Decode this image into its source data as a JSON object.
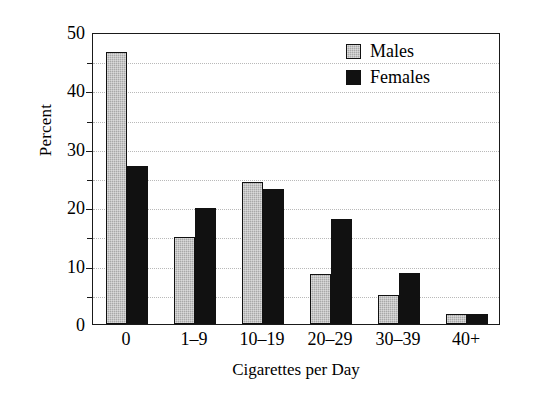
{
  "chart_data": {
    "type": "bar",
    "title": "",
    "xlabel": "Cigarettes per Day",
    "ylabel": "Percent",
    "categories": [
      "0",
      "1–9",
      "10–19",
      "20–29",
      "30–39",
      "40+"
    ],
    "series": [
      {
        "name": "Males",
        "color": "#a8a8a8",
        "values": [
          46.6,
          14.9,
          24.3,
          8.5,
          5.0,
          1.8
        ]
      },
      {
        "name": "Females",
        "color": "#111111",
        "values": [
          27.1,
          19.8,
          23.1,
          18.0,
          8.7,
          1.7
        ]
      }
    ],
    "ylim": [
      0,
      50
    ],
    "yticks": [
      0,
      10,
      20,
      30,
      40,
      50
    ],
    "yticklabels": [
      "0",
      "10",
      "20",
      "30",
      "40",
      "50"
    ],
    "yminorticks": [
      5,
      15,
      25,
      35,
      45
    ],
    "gridlines": [
      5,
      10,
      15,
      20,
      25,
      30,
      35,
      40,
      45
    ],
    "grid": true,
    "legend_position": "top-right",
    "frame": true
  },
  "legend": {
    "items": [
      {
        "label": "Males"
      },
      {
        "label": "Females"
      }
    ]
  },
  "colors": {
    "male_bar": "#a8a8a8",
    "female_bar": "#111111",
    "axis": "#1a1a1a",
    "grid": "#b9b9b9",
    "background": "#ffffff"
  }
}
